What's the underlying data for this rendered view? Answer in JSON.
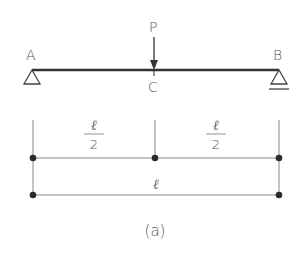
{
  "diagram": {
    "type": "simply-supported-beam",
    "caption": "(a)",
    "beam": {
      "support_left_label": "A",
      "support_left_type": "pin",
      "support_right_label": "B",
      "support_right_type": "roller",
      "load_label": "P",
      "load_point_label": "C"
    },
    "dimensions": {
      "left_segment": {
        "numerator": "ℓ",
        "denominator": "2"
      },
      "right_segment": {
        "numerator": "ℓ",
        "denominator": "2"
      },
      "total": {
        "label": "ℓ"
      }
    },
    "colors": {
      "beam": "#333333",
      "dimension_line": "#888888",
      "dot": "#2a2a2a",
      "text": "#555555"
    }
  }
}
